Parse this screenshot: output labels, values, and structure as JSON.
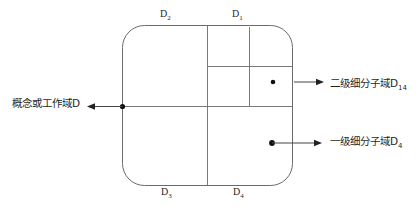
{
  "diagram": {
    "title": "",
    "type": "domain-subdivision-schematic",
    "background_color": "#ffffff",
    "line_color": "#5a5a5a",
    "marker_color": "#111111",
    "corner_labels": [
      {
        "name": "top-left",
        "text": "D",
        "sub": "2"
      },
      {
        "name": "top-right",
        "text": "D",
        "sub": "1"
      },
      {
        "name": "bottom-left",
        "text": "D",
        "sub": "3"
      },
      {
        "name": "bottom-right",
        "text": "D",
        "sub": "4"
      }
    ],
    "annotations": [
      {
        "name": "working-domain",
        "text": "概念或工作域D",
        "sub": "",
        "side": "left",
        "arrow": "left"
      },
      {
        "name": "second-level-subdomain",
        "text": "二级细分子域D",
        "sub": "14",
        "side": "right",
        "arrow": "right"
      },
      {
        "name": "first-level-subdomain",
        "text": "一级细分子域D",
        "sub": "4",
        "side": "right",
        "arrow": "right"
      }
    ]
  }
}
